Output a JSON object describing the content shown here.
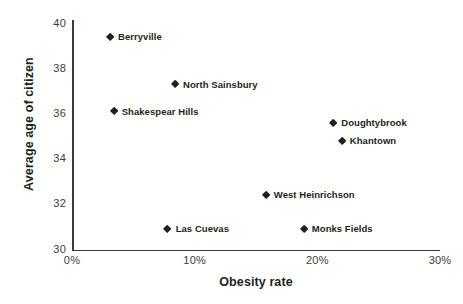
{
  "chart_data": {
    "type": "scatter",
    "title": "",
    "xlabel": "Obesity rate",
    "ylabel": "Average age of citizen",
    "xlim": [
      0,
      30
    ],
    "ylim": [
      30,
      40
    ],
    "grid": false,
    "legend": "none",
    "x_tick_labels": [
      "0%",
      "10%",
      "20%",
      "30%"
    ],
    "x_tick_values": [
      0,
      10,
      20,
      30
    ],
    "y_tick_labels": [
      "30",
      "32",
      "34",
      "36",
      "38",
      "40"
    ],
    "y_tick_values": [
      30,
      32,
      34,
      36,
      38,
      40
    ],
    "marker_color": "#231f20",
    "axis_color": "#3a3a3a",
    "points": [
      {
        "label": "Berryville",
        "x": 3.1,
        "y": 39.4
      },
      {
        "label": "North Sainsbury",
        "x": 8.4,
        "y": 37.3
      },
      {
        "label": "Shakespear Hills",
        "x": 3.4,
        "y": 36.1
      },
      {
        "label": "Doughtybrook",
        "x": 21.3,
        "y": 35.6
      },
      {
        "label": "Khantown",
        "x": 22.0,
        "y": 34.8
      },
      {
        "label": "West Heinrichson",
        "x": 15.8,
        "y": 32.4
      },
      {
        "label": "Monks Fields",
        "x": 18.9,
        "y": 30.9
      },
      {
        "label": "Las Cuevas",
        "x": 7.8,
        "y": 30.9
      }
    ]
  }
}
